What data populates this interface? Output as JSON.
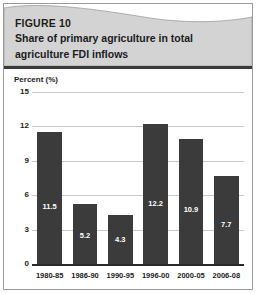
{
  "figure": {
    "label": "FIGURE 10",
    "title_line1": "Share of primary agriculture in total",
    "title_line2": "agriculture FDI inflows",
    "banner_color": "#d3d3d3",
    "rule_color": "#3a3a3a",
    "frame_color": "#9a9a9a"
  },
  "chart_data": {
    "type": "bar",
    "title": "Share of primary agriculture in total agriculture FDI inflows",
    "subtitle": "FIGURE 10",
    "xlabel": "",
    "ylabel": "Percent (%)",
    "categories": [
      "1980-85",
      "1986-90",
      "1990-95",
      "1996-00",
      "2000-05",
      "2006-08"
    ],
    "values": [
      11.5,
      5.2,
      4.3,
      12.2,
      10.9,
      7.7
    ],
    "value_labels": [
      "11.5",
      "5.2",
      "4.3",
      "12.2",
      "10.9",
      "7.7"
    ],
    "ylim": [
      0,
      15
    ],
    "yticks": [
      0,
      3,
      6,
      9,
      12,
      15
    ],
    "ytick_labels": [
      "0",
      "3",
      "6",
      "9",
      "12",
      "15"
    ],
    "grid": true,
    "legend": false,
    "bar_color": "#3b3b3b",
    "gridline_color": "#c9c9c9",
    "axis_color": "#2b2b2b",
    "value_label_color": "#ffffff"
  }
}
